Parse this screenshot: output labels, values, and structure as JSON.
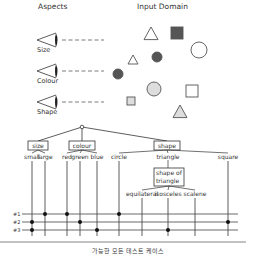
{
  "headings": {
    "aspects": "Aspects",
    "input_domain": "Input Domain"
  },
  "aspects": [
    {
      "label": "Size",
      "y": 40
    },
    {
      "label": "Colour",
      "y": 71
    },
    {
      "label": "Shape",
      "y": 102
    }
  ],
  "input_domain_shapes": [
    {
      "type": "triangle",
      "cx": 151,
      "cy": 34,
      "r": 7,
      "fill": "#ffffff"
    },
    {
      "type": "square",
      "cx": 177,
      "cy": 33,
      "r": 6,
      "fill": "#555555"
    },
    {
      "type": "circle",
      "cx": 199,
      "cy": 50,
      "r": 8,
      "fill": "#ffffff"
    },
    {
      "type": "triangle",
      "cx": 133,
      "cy": 60,
      "r": 5,
      "fill": "#ffffff"
    },
    {
      "type": "circle",
      "cx": 157,
      "cy": 57,
      "r": 5,
      "fill": "#555555"
    },
    {
      "type": "circle",
      "cx": 118,
      "cy": 74,
      "r": 5,
      "fill": "#555555"
    },
    {
      "type": "circle",
      "cx": 154,
      "cy": 89,
      "r": 7,
      "fill": "#dddddd"
    },
    {
      "type": "square",
      "cx": 192,
      "cy": 91,
      "r": 6,
      "fill": "#ffffff"
    },
    {
      "type": "square",
      "cx": 131,
      "cy": 101,
      "r": 4,
      "fill": "#dddddd"
    },
    {
      "type": "triangle",
      "cx": 180,
      "cy": 112,
      "r": 7,
      "fill": "#dddddd"
    }
  ],
  "tree": {
    "root": {
      "x": 82,
      "y": 127
    },
    "categories": [
      {
        "label": "size",
        "x": 38,
        "y": 146,
        "w": 20
      },
      {
        "label": "colour",
        "x": 82,
        "y": 146,
        "w": 26
      },
      {
        "label": "shape",
        "x": 167,
        "y": 146,
        "w": 26
      }
    ],
    "classes": [
      {
        "label": "small",
        "x": 32,
        "parent": 0
      },
      {
        "label": "large",
        "x": 45,
        "parent": 0
      },
      {
        "label": "red",
        "x": 67,
        "parent": 1
      },
      {
        "label": "green",
        "x": 80,
        "parent": 1
      },
      {
        "label": "blue",
        "x": 97,
        "parent": 1
      },
      {
        "label": "circle",
        "x": 119,
        "parent": 2
      },
      {
        "label": "triangle",
        "x": 168,
        "parent": 2
      },
      {
        "label": "square",
        "x": 228,
        "parent": 2
      }
    ],
    "sub_category": {
      "label_line1": "shape of",
      "label_line2": "triangle",
      "x": 169,
      "y": 177
    },
    "sub_classes": [
      {
        "label": "equilateral",
        "x": 142
      },
      {
        "label": "isosceles",
        "x": 168
      },
      {
        "label": "scalene",
        "x": 195
      }
    ]
  },
  "test_cases": {
    "rows": [
      {
        "label": "#1",
        "y": 214,
        "dots": [
          45,
          67,
          119
        ]
      },
      {
        "label": "#2",
        "y": 222,
        "dots": [
          32,
          80,
          228
        ]
      },
      {
        "label": "#3",
        "y": 230,
        "dots": [
          32,
          97,
          168
        ]
      }
    ],
    "leaf_x": [
      32,
      45,
      67,
      80,
      97,
      119,
      142,
      168,
      195,
      228
    ]
  },
  "caption": "가능한 모든 테스트 케이스"
}
